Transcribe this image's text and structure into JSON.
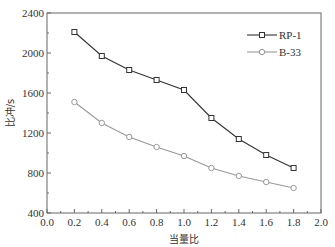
{
  "chart_data": {
    "type": "line",
    "title": "",
    "xlabel": "当量比",
    "ylabel": "比冲/s",
    "xlim": [
      0.0,
      2.0
    ],
    "ylim": [
      400,
      2400
    ],
    "grid": false,
    "legend_position": "upper right",
    "x": [
      0.2,
      0.4,
      0.6,
      0.8,
      1.0,
      1.2,
      1.4,
      1.6,
      1.8
    ],
    "xticks": [
      "0.0",
      "0.2",
      "0.4",
      "0.6",
      "0.8",
      "1.0",
      "1.2",
      "1.4",
      "1.6",
      "1.8",
      "2.0"
    ],
    "yticks": [
      "400",
      "800",
      "1200",
      "1600",
      "2000",
      "2400"
    ],
    "series": [
      {
        "name": "RP-1",
        "marker": "square",
        "color": "#333333",
        "values": [
          2210,
          1970,
          1830,
          1730,
          1630,
          1350,
          1140,
          980,
          850
        ]
      },
      {
        "name": "B-33",
        "marker": "circle",
        "color": "#999999",
        "values": [
          1510,
          1300,
          1160,
          1060,
          970,
          850,
          770,
          710,
          650
        ]
      }
    ]
  }
}
